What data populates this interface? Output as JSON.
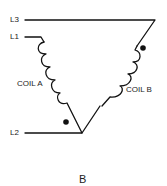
{
  "diagram": {
    "terminals": {
      "l3": "L3",
      "l1": "L1",
      "l2": "L2"
    },
    "coils": {
      "a": "COIL A",
      "b": "COIL B"
    },
    "caption": "B",
    "colors": {
      "line": "#111111",
      "background": "#ffffff"
    }
  }
}
